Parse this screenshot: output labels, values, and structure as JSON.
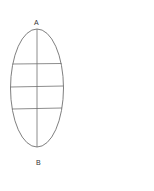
{
  "diagram": {
    "labels": {
      "top": "A",
      "bottom": "B"
    },
    "stroke_color": "#707070",
    "ellipse": {
      "cx": 37,
      "cy": 88,
      "rx": 26.5,
      "ry": 59
    },
    "axis": {
      "x": 37,
      "y1": 29,
      "y2": 147
    },
    "horizontal_lines_y": [
      64,
      86,
      108
    ]
  }
}
